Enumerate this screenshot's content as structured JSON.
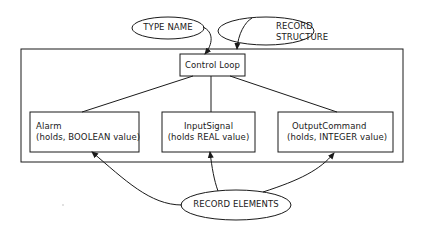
{
  "diagram": {
    "annotations": {
      "type_name": "TYPE NAME",
      "record_structure_line1": "RECORD",
      "record_structure_line2": "STRUCTURE",
      "record_elements": "RECORD ELEMENTS"
    },
    "record": {
      "name": "Control Loop"
    },
    "elements": [
      {
        "name": "Alarm",
        "detail": "(holds, BOOLEAN value)"
      },
      {
        "name": "InputSignal",
        "detail": "(holds REAL value)"
      },
      {
        "name": "OutputCommand",
        "detail": "(holds, INTEGER value)"
      }
    ],
    "colors": {
      "stroke": "#1a1a1a",
      "background": "#ffffff"
    }
  }
}
